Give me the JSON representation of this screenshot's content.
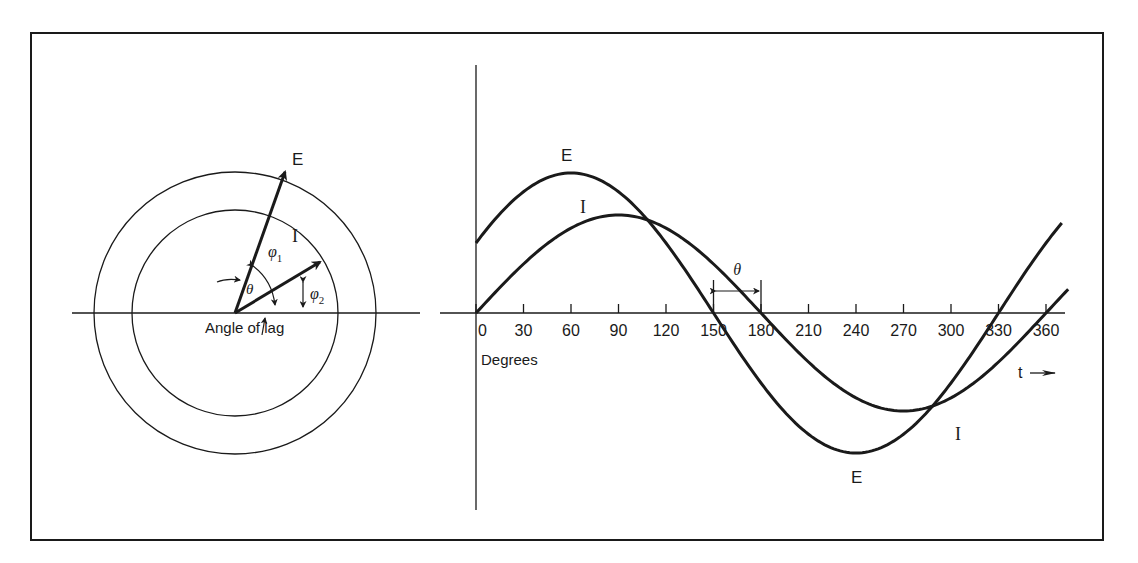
{
  "phasor_diagram": {
    "e_label": "E",
    "i_label": "I",
    "theta_label": "θ",
    "phi1_label": "φ",
    "phi1_sub": "1",
    "phi2_label": "φ",
    "phi2_sub": "2",
    "angle_of_lag_label": "Angle of lag",
    "e_angle_deg": 70,
    "i_angle_deg": 31,
    "e_magnitude_rel": 1.0,
    "i_magnitude_rel": 0.68
  },
  "chart_data": {
    "type": "line",
    "title": "",
    "xlabel": "Degrees",
    "time_label": "t",
    "ylabel": "",
    "x_ticks": [
      0,
      30,
      60,
      90,
      120,
      150,
      180,
      210,
      240,
      270,
      300,
      330,
      360
    ],
    "x_tick_labels": [
      "0",
      "30",
      "60",
      "90",
      "120",
      "150",
      "180",
      "210",
      "240",
      "270",
      "300",
      "330",
      "360"
    ],
    "xlim": [
      0,
      375
    ],
    "ylim": [
      -1.1,
      1.1
    ],
    "grid": false,
    "series": [
      {
        "name": "E",
        "amplitude": 1.0,
        "phase_deg": 30,
        "peak_x": 60,
        "zero_crossings": [
          150,
          330
        ]
      },
      {
        "name": "I",
        "amplitude": 0.7,
        "phase_deg": 0,
        "peak_x": 90,
        "zero_crossings": [
          0,
          180,
          360
        ]
      }
    ],
    "annotations": [
      {
        "text": "θ",
        "from_x": 150,
        "to_x": 180,
        "meaning": "phase lag of I behind E"
      }
    ],
    "series_labels": {
      "e_top": "E",
      "i_top": "I",
      "e_bottom": "E",
      "i_bottom": "I"
    }
  }
}
